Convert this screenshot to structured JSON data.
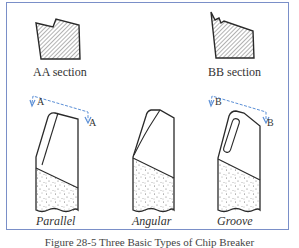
{
  "figure": {
    "sections": [
      {
        "id": "AA",
        "label": "AA section"
      },
      {
        "id": "BB",
        "label": "BB section"
      }
    ],
    "tools": [
      {
        "id": "parallel",
        "label": "Parallel"
      },
      {
        "id": "angular",
        "label": "Angular"
      },
      {
        "id": "groove",
        "label": "Groove"
      }
    ],
    "section_markers": {
      "a_left": "A",
      "a_right": "A",
      "b_left": "B",
      "b_right": "B"
    },
    "caption": "Figure 28-5  Three Basic Types of Chip Breaker",
    "colors": {
      "frame": "#7a8fc8",
      "section_line": "#5b8fd6",
      "outline": "#2a2a2a"
    }
  }
}
